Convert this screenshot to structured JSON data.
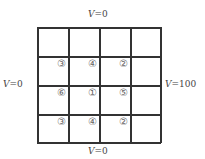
{
  "boundary": {
    "top": {
      "var": "V",
      "eq": "=0"
    },
    "bottom": {
      "var": "V",
      "eq": "=0"
    },
    "left": {
      "var": "V",
      "eq": "=0"
    },
    "right": {
      "var": "V",
      "eq": "=100"
    }
  },
  "grid": {
    "rows": 4,
    "cols": 4,
    "nodes": [
      {
        "label": "③",
        "row": 1,
        "col": 1
      },
      {
        "label": "④",
        "row": 1,
        "col": 2
      },
      {
        "label": "②",
        "row": 1,
        "col": 3
      },
      {
        "label": "⑥",
        "row": 2,
        "col": 1
      },
      {
        "label": "①",
        "row": 2,
        "col": 2
      },
      {
        "label": "⑤",
        "row": 2,
        "col": 3
      },
      {
        "label": "③",
        "row": 3,
        "col": 1
      },
      {
        "label": "④",
        "row": 3,
        "col": 2
      },
      {
        "label": "②",
        "row": 3,
        "col": 3
      }
    ]
  }
}
